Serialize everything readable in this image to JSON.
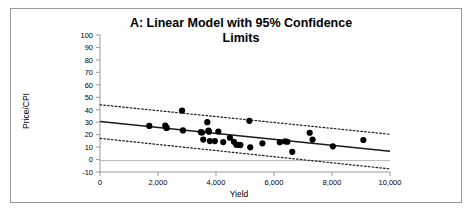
{
  "figure": {
    "title_line_1": "A: Linear Model with 95% Confidence",
    "title_line_2": "Limits",
    "border_color": "#9a9a9a",
    "background": "#ffffff"
  },
  "chart_data": {
    "type": "scatter",
    "xlabel": "Yield",
    "ylabel": "Price/CPI",
    "xlim": [
      0,
      10000
    ],
    "ylim": [
      -10,
      100
    ],
    "grid": false,
    "legend": "none",
    "xticks": [
      0,
      2000,
      4000,
      6000,
      8000,
      10000
    ],
    "xtick_labels": [
      "0",
      "2,000",
      "4,000",
      "6,000",
      "8,000",
      "10,000"
    ],
    "yticks": [
      -10,
      0,
      10,
      20,
      30,
      40,
      50,
      60,
      70,
      80,
      90,
      100
    ],
    "ytick_labels": [
      "-10",
      "0",
      "10",
      "20",
      "30",
      "40",
      "50",
      "60",
      "70",
      "80",
      "90",
      "100"
    ],
    "marker": {
      "shape": "circle",
      "color": "#000000",
      "size": 3.1
    },
    "points": [
      {
        "x": 1700,
        "y": 27.0
      },
      {
        "x": 2250,
        "y": 27.3
      },
      {
        "x": 2280,
        "y": 25.8
      },
      {
        "x": 2300,
        "y": 25.4
      },
      {
        "x": 2830,
        "y": 39.3
      },
      {
        "x": 2860,
        "y": 23.4
      },
      {
        "x": 3480,
        "y": 22.0
      },
      {
        "x": 3520,
        "y": 21.7
      },
      {
        "x": 3560,
        "y": 16.0
      },
      {
        "x": 3700,
        "y": 30.0
      },
      {
        "x": 3740,
        "y": 23.2
      },
      {
        "x": 3760,
        "y": 22.3
      },
      {
        "x": 3790,
        "y": 14.8
      },
      {
        "x": 3960,
        "y": 14.8
      },
      {
        "x": 4080,
        "y": 22.5
      },
      {
        "x": 4250,
        "y": 14.0
      },
      {
        "x": 4480,
        "y": 17.5
      },
      {
        "x": 4620,
        "y": 14.3
      },
      {
        "x": 4700,
        "y": 11.8
      },
      {
        "x": 4790,
        "y": 11.8
      },
      {
        "x": 4840,
        "y": 11.6
      },
      {
        "x": 5150,
        "y": 31.1
      },
      {
        "x": 5180,
        "y": 9.8
      },
      {
        "x": 5600,
        "y": 13.0
      },
      {
        "x": 6200,
        "y": 13.9
      },
      {
        "x": 6380,
        "y": 14.6
      },
      {
        "x": 6460,
        "y": 14.3
      },
      {
        "x": 6630,
        "y": 6.2
      },
      {
        "x": 7230,
        "y": 21.5
      },
      {
        "x": 7330,
        "y": 16.0
      },
      {
        "x": 8030,
        "y": 10.6
      },
      {
        "x": 9080,
        "y": 15.7
      }
    ],
    "fit_line": {
      "name": "Linear model fit",
      "style": "solid",
      "color": "#1a1a1a",
      "endpoints": [
        {
          "x": 0,
          "y": 30.5
        },
        {
          "x": 10000,
          "y": 6.7
        }
      ]
    },
    "confidence_bands": [
      {
        "name": "Upper 95% confidence limit",
        "style": "dotted",
        "color": "#1a1a1a",
        "endpoints": [
          {
            "x": 0,
            "y": 44.0
          },
          {
            "x": 10000,
            "y": 20.3
          }
        ]
      },
      {
        "name": "Lower 95% confidence limit",
        "style": "dotted",
        "color": "#1a1a1a",
        "endpoints": [
          {
            "x": 0,
            "y": 17.0
          },
          {
            "x": 10000,
            "y": -7.5
          }
        ]
      }
    ]
  }
}
